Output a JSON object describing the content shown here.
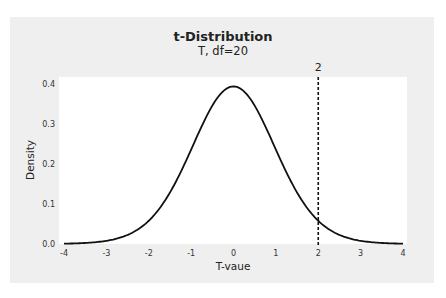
{
  "chart_data": {
    "type": "line",
    "title": "t-Distribution",
    "subtitle": "T, df=20",
    "xlabel": "T-vaue",
    "ylabel": "Density",
    "xlim": [
      -4,
      4
    ],
    "ylim": [
      0,
      0.4
    ],
    "xticks": [
      -4,
      -3,
      -2,
      -1,
      0,
      1,
      2,
      3,
      4
    ],
    "yticks": [
      0.0,
      0.1,
      0.2,
      0.3,
      0.4
    ],
    "ytick_labels": [
      "0.0",
      "0.1",
      "0.2",
      "0.3",
      "0.4"
    ],
    "grid": false,
    "series": [
      {
        "name": "t pdf, df=20",
        "x": [
          -4,
          -3.5,
          -3,
          -2.5,
          -2,
          -1.5,
          -1,
          -0.5,
          0,
          0.5,
          1,
          1.5,
          2,
          2.5,
          3,
          3.5,
          4
        ],
        "values": [
          0.0007,
          0.002,
          0.0067,
          0.0209,
          0.0585,
          0.1294,
          0.236,
          0.3468,
          0.394,
          0.3468,
          0.236,
          0.1294,
          0.0585,
          0.0209,
          0.0067,
          0.002,
          0.0007
        ]
      }
    ],
    "annotations": [
      {
        "type": "vline",
        "x": 2,
        "style": "dashed",
        "label": "2"
      }
    ],
    "legend": "none"
  },
  "title": "t-Distribution",
  "subtitle": "T, df=20"
}
